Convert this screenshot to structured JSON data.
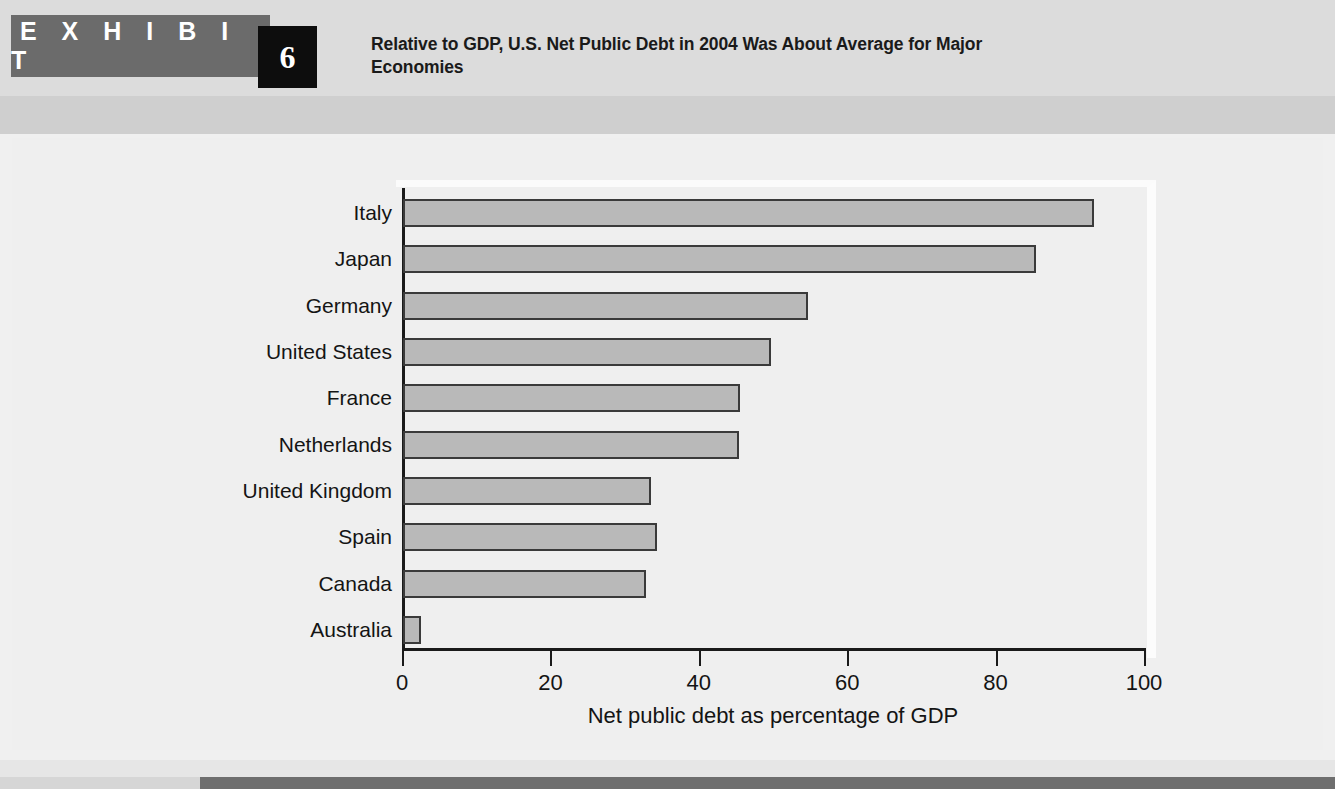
{
  "exhibit": {
    "label": "E X H I B I T",
    "number": "6",
    "title": "Relative to GDP, U.S. Net Public Debt in 2004 Was About Average for Major Economies"
  },
  "colors": {
    "band": "#6b6b6b",
    "number_box": "#0d0d0d",
    "bar_fill": "#b9b9b9",
    "bar_stroke": "#3a3a3a",
    "panel": "#efefef",
    "footer_bar": "#6e6e6e"
  },
  "chart_data": {
    "type": "bar",
    "orientation": "horizontal",
    "title": "Relative to GDP, U.S. Net Public Debt in 2004 Was About Average for Major Economies",
    "categories": [
      "Italy",
      "Japan",
      "Germany",
      "United States",
      "France",
      "Netherlands",
      "United Kingdom",
      "Spain",
      "Canada",
      "Australia"
    ],
    "values": [
      93.1,
      85.3,
      54.6,
      49.6,
      45.4,
      45.3,
      33.4,
      34.2,
      32.7,
      2.4
    ],
    "xlabel": "Net public debt as percentage of GDP",
    "ylabel": "",
    "xlim": [
      0,
      100
    ],
    "xticks": [
      0,
      20,
      40,
      60,
      80,
      100
    ],
    "xtick_labels": [
      "0",
      "20",
      "40",
      "60",
      "80",
      "100"
    ],
    "grid": false,
    "legend": false
  }
}
